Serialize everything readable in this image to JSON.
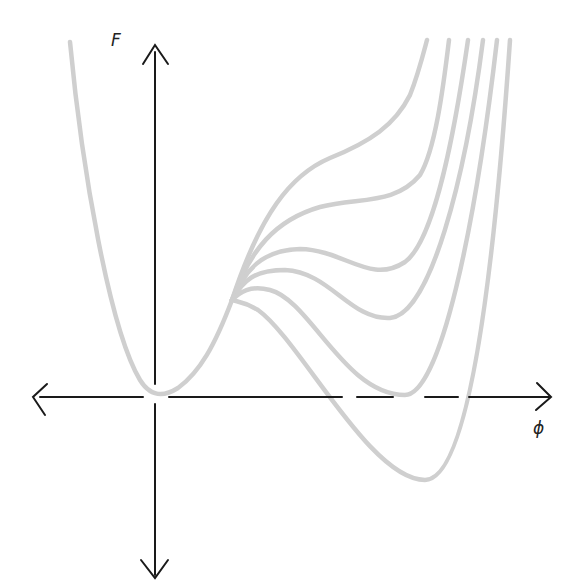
{
  "diagram": {
    "title": "",
    "axes": {
      "y_label": "F",
      "x_label": "ϕ",
      "y_arrows": [
        "up",
        "down"
      ],
      "x_arrows": [
        "left",
        "right"
      ]
    },
    "colors": {
      "axis": "#1a1a1a",
      "curve": "#cfcfcf",
      "background": "#ffffff"
    },
    "curves": [
      {
        "id": "curve-1",
        "second_minimum": "none (shoulder/inflection)"
      },
      {
        "id": "curve-2",
        "second_minimum": "shallow metastable, high above axis"
      },
      {
        "id": "curve-3",
        "second_minimum": "metastable, above axis"
      },
      {
        "id": "curve-4",
        "second_minimum": "metastable, above axis"
      },
      {
        "id": "curve-5",
        "second_minimum": "equal to origin minimum (on axis)"
      },
      {
        "id": "curve-6",
        "second_minimum": "stable, below axis"
      }
    ]
  }
}
